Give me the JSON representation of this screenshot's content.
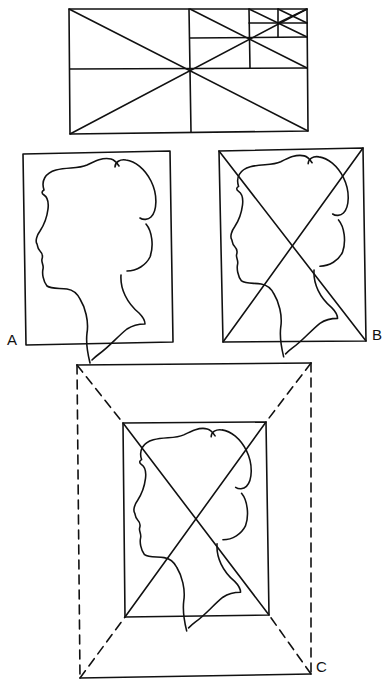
{
  "figure": {
    "type": "diagram",
    "stroke_color": "#111111",
    "background_color": "#ffffff"
  },
  "top_panel": {
    "name": "golden-rectangle-subdivision",
    "outer_rect": {
      "x1": 69,
      "y1": 9,
      "x2": 307,
      "y2": 134
    },
    "center": {
      "x": 190,
      "y": 69
    },
    "subdivisions": [
      {
        "level": 1,
        "rect": {
          "x1": 190,
          "y1": 9,
          "x2": 307,
          "y2": 69
        },
        "center": {
          "x": 249,
          "y": 38
        }
      },
      {
        "level": 2,
        "rect": {
          "x1": 249,
          "y1": 9,
          "x2": 307,
          "y2": 38
        },
        "center": {
          "x": 278,
          "y": 23
        }
      },
      {
        "level": 3,
        "rect": {
          "x1": 278,
          "y1": 9,
          "x2": 307,
          "y2": 23
        },
        "center": {
          "x": 292,
          "y": 16
        }
      }
    ]
  },
  "panels": [
    {
      "id": "A",
      "label": "A",
      "rect": {
        "x1": 23,
        "y1": 151,
        "x2": 173,
        "y2": 345
      },
      "has_diagonals": false
    },
    {
      "id": "B",
      "label": "B",
      "rect": {
        "x1": 219,
        "y1": 149,
        "x2": 366,
        "y2": 341
      },
      "has_diagonals": true
    },
    {
      "id": "C",
      "label": "C",
      "outer_rect": {
        "x1": 77,
        "y1": 365,
        "x2": 311,
        "y2": 677
      },
      "outer_sides_style": "dashed",
      "outer_top_bottom_style": "solid",
      "inner_rect": {
        "x1": 123,
        "y1": 423,
        "x2": 269,
        "y2": 617
      },
      "has_diagonals": true,
      "dashed_corner_connectors": true
    }
  ],
  "labels": {
    "a": "A",
    "b": "B",
    "c": "C"
  }
}
